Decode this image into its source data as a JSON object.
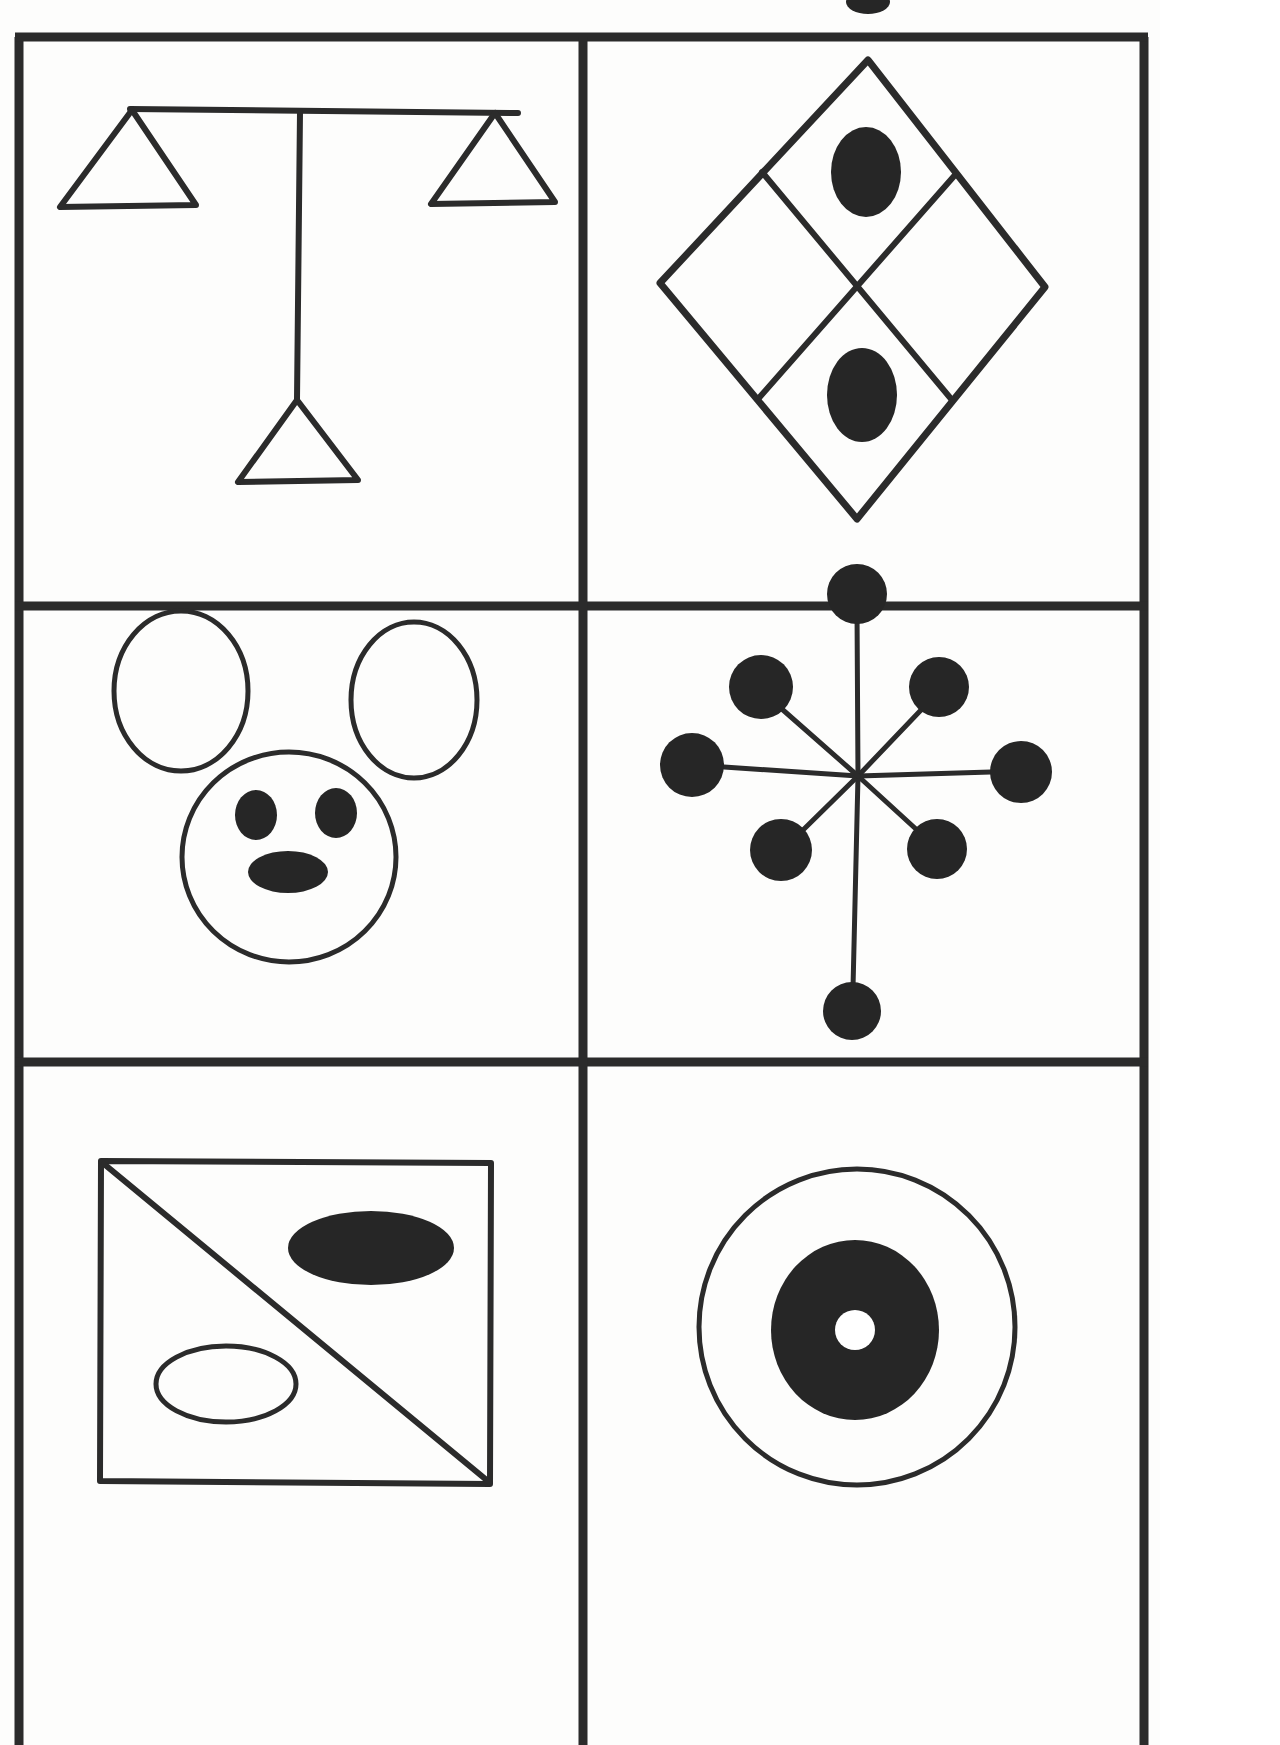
{
  "page": {
    "background_color": "#fdfdfc",
    "ink_color": "#2b2b2b",
    "fill_color": "#262626",
    "width": 1160,
    "height": 1745,
    "border_stroke_width": 9,
    "layout": {
      "columns": 2,
      "rows": 3,
      "grid_left": 19,
      "grid_right": 1144,
      "grid_top": 33,
      "vertical_divider_x": 583,
      "row_divider_1_y": 606,
      "row_divider_2_y": 1062,
      "grid_bottom_visible": 1745
    }
  },
  "clipped_mark": {
    "name": "partial-dot-top-edge",
    "description": "small black blob clipped by the top edge of the page",
    "cx": 868,
    "cy": 2,
    "rx": 22,
    "ry": 12
  },
  "panels": [
    {
      "id": "panel-1",
      "position": "row-1-col-1",
      "name": "balance-scale-figure",
      "label": "Balance scale: horizontal beam with two upward triangles at the ends, vertical stem, and a triangle base",
      "shapes": [
        {
          "type": "line",
          "name": "scale-beam",
          "x1": 130,
          "y1": 109,
          "x2": 518,
          "y2": 113
        },
        {
          "type": "triangle",
          "name": "left-pan-triangle",
          "apex_x": 132,
          "apex_y": 110,
          "left_x": 60,
          "left_y": 207,
          "right_x": 196,
          "right_y": 205
        },
        {
          "type": "triangle",
          "name": "right-pan-triangle",
          "apex_x": 495,
          "apex_y": 113,
          "left_x": 431,
          "left_y": 204,
          "right_x": 555,
          "right_y": 202
        },
        {
          "type": "line",
          "name": "center-stem",
          "x1": 300,
          "y1": 112,
          "x2": 297,
          "y2": 400
        },
        {
          "type": "triangle",
          "name": "base-triangle",
          "apex_x": 297,
          "apex_y": 400,
          "left_x": 238,
          "left_y": 482,
          "right_x": 358,
          "right_y": 480
        }
      ]
    },
    {
      "id": "panel-2",
      "position": "row-1-col-2",
      "name": "quartered-diamond-figure",
      "label": "Large diamond divided into four quadrants with filled ovals in the top and bottom quadrants",
      "shapes": [
        {
          "type": "diamond",
          "name": "outer-diamond",
          "top_x": 868,
          "top_y": 60,
          "right_x": 1045,
          "right_y": 287,
          "bottom_x": 857,
          "bottom_y": 519,
          "left_x": 660,
          "left_y": 283
        },
        {
          "type": "line",
          "name": "diagonal-divider-a",
          "x1": 762,
          "y1": 172,
          "x2": 952,
          "y2": 400
        },
        {
          "type": "line",
          "name": "diagonal-divider-b",
          "x1": 955,
          "y1": 175,
          "x2": 758,
          "y2": 399
        },
        {
          "type": "ellipse",
          "name": "top-quadrant-oval",
          "cx": 866,
          "cy": 172,
          "rx": 35,
          "ry": 45,
          "filled": true
        },
        {
          "type": "ellipse",
          "name": "bottom-quadrant-oval",
          "cx": 862,
          "cy": 395,
          "rx": 35,
          "ry": 47,
          "filled": true
        }
      ]
    },
    {
      "id": "panel-3",
      "position": "row-2-col-1",
      "name": "mouse-face-figure",
      "label": "Mouse or bear face: two outlined ear ovals, outlined round head, two filled eyes and a filled oval nose",
      "shapes": [
        {
          "type": "ellipse",
          "name": "left-ear",
          "cx": 181,
          "cy": 691,
          "rx": 67,
          "ry": 80,
          "filled": false
        },
        {
          "type": "ellipse",
          "name": "right-ear",
          "cx": 414,
          "cy": 700,
          "rx": 63,
          "ry": 78,
          "filled": false
        },
        {
          "type": "ellipse",
          "name": "head",
          "cx": 289,
          "cy": 857,
          "rx": 107,
          "ry": 105,
          "filled": false
        },
        {
          "type": "ellipse",
          "name": "left-eye",
          "cx": 256,
          "cy": 815,
          "rx": 21,
          "ry": 25,
          "filled": true
        },
        {
          "type": "ellipse",
          "name": "right-eye",
          "cx": 336,
          "cy": 813,
          "rx": 21,
          "ry": 25,
          "filled": true
        },
        {
          "type": "ellipse",
          "name": "nose",
          "cx": 288,
          "cy": 872,
          "rx": 40,
          "ry": 21,
          "filled": true
        }
      ]
    },
    {
      "id": "panel-4",
      "position": "row-2-col-2",
      "name": "eight-spoke-dot-star-figure",
      "label": "Eight spokes radiating from a center point, each ending in a filled black circle; the lower vertical spoke is extra long",
      "center": {
        "x": 858,
        "y": 776
      },
      "spokes": [
        {
          "name": "spoke-up",
          "angle_deg": 90,
          "dot_cx": 857,
          "dot_cy": 594,
          "dot_r": 30,
          "line_to_x": 857,
          "line_to_y": 624
        },
        {
          "name": "spoke-up-right",
          "angle_deg": 45,
          "dot_cx": 939,
          "dot_cy": 687,
          "dot_r": 30,
          "line_to_x": 921,
          "line_to_y": 710
        },
        {
          "name": "spoke-right",
          "angle_deg": 0,
          "dot_cx": 1021,
          "dot_cy": 772,
          "dot_r": 31,
          "line_to_x": 991,
          "line_to_y": 772
        },
        {
          "name": "spoke-down-right",
          "angle_deg": -45,
          "dot_cx": 937,
          "dot_cy": 849,
          "dot_r": 30,
          "line_to_x": 917,
          "line_to_y": 830
        },
        {
          "name": "spoke-down",
          "angle_deg": -90,
          "dot_cx": 852,
          "dot_cy": 1011,
          "dot_r": 29,
          "line_to_x": 853,
          "line_to_y": 982
        },
        {
          "name": "spoke-down-left",
          "angle_deg": -135,
          "dot_cx": 781,
          "dot_cy": 850,
          "dot_r": 31,
          "line_to_x": 801,
          "line_to_y": 832
        },
        {
          "name": "spoke-left",
          "angle_deg": 180,
          "dot_cx": 692,
          "dot_cy": 765,
          "dot_r": 32,
          "line_to_x": 724,
          "line_to_y": 767
        },
        {
          "name": "spoke-up-left",
          "angle_deg": 135,
          "dot_cx": 761,
          "dot_cy": 687,
          "dot_r": 32,
          "line_to_x": 783,
          "line_to_y": 710
        }
      ]
    },
    {
      "id": "panel-5",
      "position": "row-3-col-1",
      "name": "square-diagonal-ovals-figure",
      "label": "Square with a diagonal from top-left to bottom-right, a filled ellipse upper-right and an outlined ellipse lower-left",
      "shapes": [
        {
          "type": "rect",
          "name": "outer-square",
          "x": 100,
          "y": 1160,
          "width": 392,
          "height": 325
        },
        {
          "type": "line",
          "name": "diagonal-line",
          "x1": 103,
          "y1": 1163,
          "x2": 489,
          "y2": 1482
        },
        {
          "type": "ellipse",
          "name": "filled-ellipse",
          "cx": 371,
          "cy": 1248,
          "rx": 83,
          "ry": 37,
          "filled": true
        },
        {
          "type": "ellipse",
          "name": "outlined-ellipse",
          "cx": 226,
          "cy": 1384,
          "rx": 70,
          "ry": 38,
          "filled": false
        }
      ]
    },
    {
      "id": "panel-6",
      "position": "row-3-col-2",
      "name": "bullseye-target-figure",
      "label": "Concentric target: large outlined circle, solid black inner disc, tiny white dot at the centre",
      "shapes": [
        {
          "type": "circle",
          "name": "outer-ring",
          "cx": 857,
          "cy": 1327,
          "r": 158,
          "filled": false
        },
        {
          "type": "circle",
          "name": "inner-black-disc",
          "cx": 855,
          "cy": 1330,
          "r": 86,
          "filled": true
        },
        {
          "type": "circle",
          "name": "centre-white-dot",
          "cx": 855,
          "cy": 1330,
          "r": 20,
          "filled": false,
          "color": "#ffffff"
        }
      ]
    }
  ]
}
